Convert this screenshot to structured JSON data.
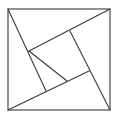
{
  "diagram": {
    "stroke_color": "#3a3a3a",
    "background": "#ffffff",
    "outer_square": [
      [
        8,
        9
      ],
      [
        110,
        9
      ],
      [
        110,
        110
      ],
      [
        8,
        110
      ]
    ],
    "inner_square": [
      [
        29,
        51
      ],
      [
        70,
        31
      ],
      [
        89,
        71
      ],
      [
        46,
        91
      ]
    ],
    "lines": [
      {
        "name": "line-topleft-to-bottom",
        "from": [
          8,
          9
        ],
        "to": [
          46,
          91
        ]
      },
      {
        "name": "line-topright-to-left",
        "from": [
          110,
          9
        ],
        "to": [
          29,
          51
        ]
      },
      {
        "name": "line-bottomright-to-top",
        "from": [
          110,
          110
        ],
        "to": [
          70,
          31
        ]
      },
      {
        "name": "line-bottomleft-to-right",
        "from": [
          8,
          110
        ],
        "to": [
          89,
          71
        ]
      },
      {
        "name": "inner-diagonal",
        "from": [
          29,
          51
        ],
        "to": [
          67,
          81
        ]
      }
    ]
  }
}
